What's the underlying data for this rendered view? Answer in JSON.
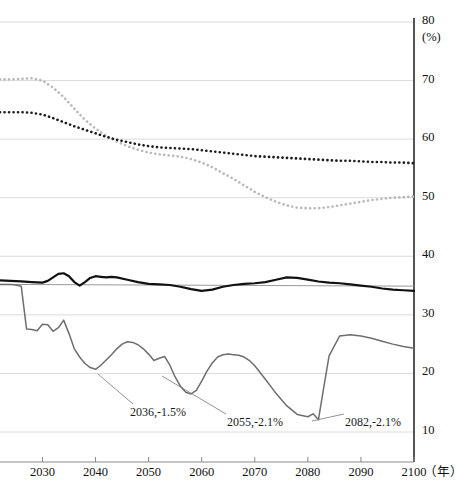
{
  "chart_data": {
    "type": "line",
    "title": "",
    "xlabel": "年",
    "ylabel": "(%)",
    "xlim": [
      2022,
      2100
    ],
    "ylim": [
      7.27,
      80
    ],
    "grid": true,
    "legend_position": "none",
    "x_ticks": [
      2030,
      2040,
      2050,
      2060,
      2070,
      2080,
      2090,
      2100
    ],
    "x_tick_labels": [
      "2030",
      "2040",
      "2050",
      "2060",
      "2070",
      "2080",
      "2090",
      "2100"
    ],
    "y_ticks": [
      10,
      20,
      30,
      40,
      50,
      60,
      70,
      80
    ],
    "y_tick_labels": [
      "10",
      "20",
      "30",
      "40",
      "50",
      "60",
      "70",
      "80"
    ],
    "series": [
      {
        "name": "light-gray-dotted-upper",
        "style": "dotted",
        "color": "#b9b9b9",
        "x": [
          2022,
          2024,
          2026,
          2028,
          2030,
          2032,
          2034,
          2036,
          2038,
          2040,
          2042,
          2044,
          2046,
          2048,
          2050,
          2052,
          2054,
          2056,
          2058,
          2060,
          2062,
          2064,
          2066,
          2068,
          2070,
          2072,
          2074,
          2076,
          2078,
          2080,
          2082,
          2084,
          2086,
          2088,
          2090,
          2092,
          2094,
          2096,
          2098,
          2100
        ],
        "values": [
          70.2,
          70.2,
          70.3,
          70.4,
          70.0,
          68.8,
          67.2,
          65.2,
          63.3,
          61.8,
          60.6,
          59.6,
          58.8,
          58.2,
          57.7,
          57.4,
          57.2,
          57.0,
          56.6,
          56.0,
          55.2,
          54.2,
          53.2,
          52.1,
          51.0,
          50.1,
          49.3,
          48.7,
          48.3,
          48.2,
          48.2,
          48.4,
          48.7,
          49.0,
          49.3,
          49.6,
          49.8,
          50.0,
          50.1,
          50.2
        ]
      },
      {
        "name": "dark-dotted-upper",
        "style": "dotted",
        "color": "#1d1d1d",
        "x": [
          2022,
          2024,
          2026,
          2028,
          2030,
          2032,
          2034,
          2036,
          2038,
          2040,
          2042,
          2044,
          2046,
          2048,
          2050,
          2052,
          2054,
          2056,
          2058,
          2060,
          2062,
          2064,
          2066,
          2068,
          2070,
          2072,
          2074,
          2076,
          2078,
          2080,
          2082,
          2084,
          2086,
          2088,
          2090,
          2092,
          2094,
          2096,
          2098,
          2100
        ],
        "values": [
          64.6,
          64.6,
          64.6,
          64.5,
          64.2,
          63.6,
          62.9,
          62.2,
          61.6,
          61.0,
          60.4,
          59.9,
          59.5,
          59.1,
          58.8,
          58.6,
          58.5,
          58.4,
          58.3,
          58.1,
          57.9,
          57.7,
          57.5,
          57.3,
          57.1,
          57.0,
          56.9,
          56.8,
          56.7,
          56.6,
          56.5,
          56.4,
          56.3,
          56.3,
          56.2,
          56.1,
          56.1,
          56.0,
          56.0,
          55.9
        ]
      },
      {
        "name": "thin-gray-flat",
        "style": "solid-thin",
        "color": "#8c8c8c",
        "x": [
          2022,
          2100
        ],
        "values": [
          35.2,
          34.9
        ]
      },
      {
        "name": "thick-black-wavy",
        "style": "solid-thick",
        "color": "#111111",
        "x": [
          2022,
          2024,
          2026,
          2028,
          2030,
          2031,
          2032,
          2033,
          2034,
          2035,
          2036,
          2037,
          2038,
          2039,
          2040,
          2041,
          2042,
          2043,
          2044,
          2046,
          2048,
          2050,
          2052,
          2054,
          2056,
          2058,
          2060,
          2062,
          2064,
          2066,
          2068,
          2070,
          2072,
          2074,
          2076,
          2078,
          2080,
          2082,
          2084,
          2086,
          2088,
          2090,
          2092,
          2094,
          2096,
          2098,
          2100
        ],
        "values": [
          35.9,
          35.8,
          35.7,
          35.6,
          35.5,
          35.8,
          36.4,
          37.0,
          37.1,
          36.6,
          35.6,
          35.0,
          35.6,
          36.3,
          36.6,
          36.5,
          36.4,
          36.5,
          36.4,
          36.0,
          35.6,
          35.3,
          35.2,
          35.1,
          34.8,
          34.4,
          34.1,
          34.3,
          34.8,
          35.1,
          35.3,
          35.4,
          35.6,
          36.0,
          36.4,
          36.3,
          36.0,
          35.7,
          35.5,
          35.4,
          35.2,
          35.0,
          34.8,
          34.5,
          34.3,
          34.2,
          34.1
        ]
      },
      {
        "name": "gray-declining-lower",
        "style": "solid-medium",
        "color": "#6e6e6e",
        "x": [
          2022,
          2024,
          2025,
          2026,
          2027,
          2028,
          2029,
          2030,
          2031,
          2032,
          2033,
          2034,
          2035,
          2036,
          2037,
          2038,
          2039,
          2040,
          2041,
          2042,
          2043,
          2044,
          2045,
          2046,
          2047,
          2048,
          2049,
          2050,
          2051,
          2052,
          2053,
          2054,
          2055,
          2056,
          2057,
          2058,
          2059,
          2060,
          2061,
          2062,
          2063,
          2064,
          2065,
          2066,
          2067,
          2068,
          2069,
          2070,
          2072,
          2074,
          2076,
          2078,
          2080,
          2081,
          2082,
          2083,
          2084,
          2086,
          2088,
          2090,
          2092,
          2094,
          2096,
          2098,
          2100
        ],
        "values": [
          35.2,
          35.2,
          35.1,
          34.9,
          27.6,
          27.5,
          27.3,
          28.4,
          28.3,
          27.2,
          27.8,
          29.1,
          26.8,
          24.2,
          22.8,
          21.7,
          21.0,
          20.7,
          21.4,
          22.3,
          23.2,
          24.2,
          25.0,
          25.4,
          25.3,
          24.9,
          24.2,
          23.3,
          22.2,
          22.6,
          22.9,
          21.4,
          19.4,
          17.8,
          16.8,
          16.5,
          17.1,
          18.7,
          20.4,
          21.8,
          22.8,
          23.2,
          23.3,
          23.2,
          23.1,
          22.8,
          22.2,
          21.3,
          19.0,
          16.6,
          14.5,
          13.0,
          12.6,
          13.1,
          12.1,
          17.6,
          23.0,
          26.4,
          26.6,
          26.4,
          26.0,
          25.5,
          25.0,
          24.6,
          24.3
        ]
      }
    ],
    "annotations": [
      {
        "id": "annotation-2036",
        "label": "2036,-1.5%",
        "x_text": 130,
        "y_text": 405,
        "leader_from": [
          133,
          404
        ],
        "leader_to": [
          98,
          374
        ]
      },
      {
        "id": "annotation-2055",
        "label": "2055,-2.1%",
        "x_text": 227,
        "y_text": 415,
        "leader_from": [
          226,
          414
        ],
        "leader_to": [
          162,
          376
        ]
      },
      {
        "id": "annotation-2082",
        "label": "2082,-2.1%",
        "x_text": 345,
        "y_text": 415,
        "leader_from": [
          344,
          414
        ],
        "leader_to": [
          312,
          421
        ]
      }
    ]
  },
  "axis": {
    "y_unit": "(%)",
    "x_unit": "（年）"
  }
}
